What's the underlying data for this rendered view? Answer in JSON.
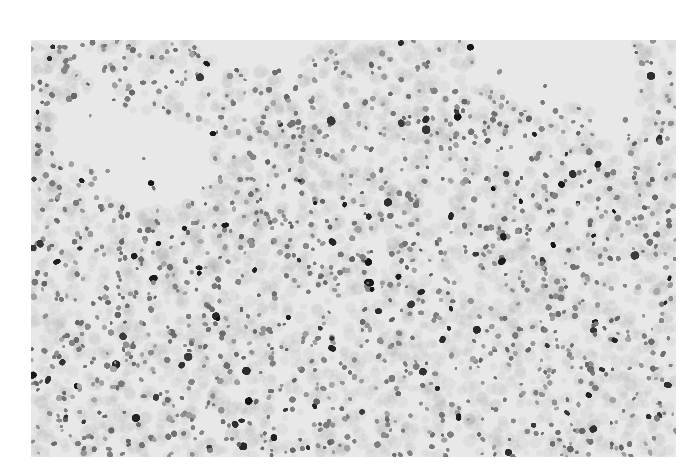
{
  "figure": {
    "kind": "grayscale histology micrograph",
    "colors": {
      "page_background": "#ffffff",
      "slide_background": "#e8e8e8",
      "nucleus_light": "#8a8a8a",
      "nucleus_dark": "#1a1a1a"
    },
    "frame": {
      "x": 31,
      "y": 40,
      "width": 645,
      "height": 417
    },
    "clear_regions": [
      {
        "desc": "top-center empty space",
        "cx": 230,
        "cy": 0,
        "rx": 60,
        "ry": 30
      },
      {
        "desc": "top-right empty space",
        "cx": 520,
        "cy": 0,
        "rx": 80,
        "ry": 70
      },
      {
        "desc": "top-right notch",
        "cx": 585,
        "cy": 50,
        "rx": 25,
        "ry": 55
      },
      {
        "desc": "upper-left pale area",
        "cx": 120,
        "cy": 120,
        "rx": 60,
        "ry": 50
      },
      {
        "desc": "upper-left pale streak",
        "cx": 60,
        "cy": 90,
        "rx": 40,
        "ry": 35
      }
    ]
  }
}
